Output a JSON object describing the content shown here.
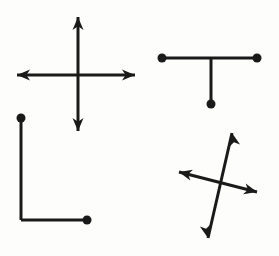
{
  "canvas": {
    "width": 279,
    "height": 256,
    "background_color": "#fdfdfc",
    "ink_color": "#1a1a1a",
    "stroke_width": 3,
    "dot_radius": 4.5,
    "arrow_length": 13,
    "arrow_half_width": 5.5,
    "description": "Four simple black line figures drawn on a plain white background"
  },
  "figures": [
    {
      "id": "plus-arrows",
      "name": "four-way-arrow-cross",
      "position": "top-left",
      "segments": [
        {
          "name": "horizontal-axis",
          "x1": 17,
          "y1": 75,
          "x2": 135,
          "y2": 75
        },
        {
          "name": "vertical-axis",
          "x1": 78,
          "y1": 17,
          "x2": 78,
          "y2": 131
        }
      ],
      "arrowheads": [
        {
          "name": "arrow-left",
          "x": 17,
          "y": 75,
          "angle": 180
        },
        {
          "name": "arrow-right",
          "x": 135,
          "y": 75,
          "angle": 0
        },
        {
          "name": "arrow-up",
          "x": 78,
          "y": 17,
          "angle": -90
        },
        {
          "name": "arrow-down",
          "x": 78,
          "y": 131,
          "angle": 90
        }
      ],
      "dots": []
    },
    {
      "id": "t-shape",
      "name": "t-shape-with-dots",
      "position": "top-right",
      "segments": [
        {
          "name": "t-crossbar",
          "x1": 162,
          "y1": 58,
          "x2": 257,
          "y2": 58
        },
        {
          "name": "t-stem",
          "x1": 211,
          "y1": 58,
          "x2": 211,
          "y2": 104
        }
      ],
      "arrowheads": [],
      "dots": [
        {
          "name": "dot-crossbar-left",
          "x": 162,
          "y": 58
        },
        {
          "name": "dot-crossbar-right",
          "x": 257,
          "y": 58
        },
        {
          "name": "dot-stem-bottom",
          "x": 211,
          "y": 104
        }
      ]
    },
    {
      "id": "l-shape",
      "name": "l-shape-with-dots",
      "position": "bottom-left",
      "segments": [
        {
          "name": "l-vertical",
          "x1": 21,
          "y1": 118,
          "x2": 21,
          "y2": 220
        },
        {
          "name": "l-horizontal",
          "x1": 21,
          "y1": 220,
          "x2": 87,
          "y2": 220
        }
      ],
      "arrowheads": [],
      "dots": [
        {
          "name": "dot-vertical-top",
          "x": 21,
          "y": 118
        },
        {
          "name": "dot-horizontal-right",
          "x": 87,
          "y": 220
        }
      ]
    },
    {
      "id": "tilted-cross-arrows",
      "name": "tilted-four-way-arrow-cross",
      "position": "bottom-right",
      "segments": [
        {
          "name": "diagonal-steep",
          "x1": 232,
          "y1": 133,
          "x2": 208,
          "y2": 238
        },
        {
          "name": "diagonal-shallow",
          "x1": 179,
          "y1": 172,
          "x2": 257,
          "y2": 192
        }
      ],
      "arrowheads": [
        {
          "name": "arrow-upper-right",
          "x": 232,
          "y": 133,
          "angle": -102
        },
        {
          "name": "arrow-lower-left-down",
          "x": 208,
          "y": 238,
          "angle": 78
        },
        {
          "name": "arrow-upper-left",
          "x": 179,
          "y": 172,
          "angle": 194
        },
        {
          "name": "arrow-lower-right",
          "x": 257,
          "y": 192,
          "angle": 14
        }
      ],
      "dots": []
    }
  ]
}
